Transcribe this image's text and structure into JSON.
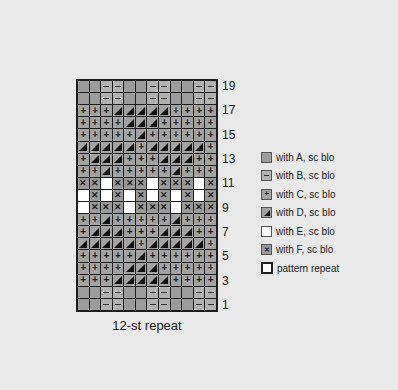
{
  "chart_data": {
    "type": "table",
    "title": "",
    "caption": "12-st repeat",
    "columns": 12,
    "rows": 19,
    "row_labels_shown": [
      "19",
      "17",
      "15",
      "13",
      "11",
      "9",
      "7",
      "5",
      "3",
      "1"
    ],
    "grid_top_to_bottom": [
      {
        "row": 19,
        "cells": [
          "A",
          "A",
          "B",
          "B",
          "A",
          "A",
          "B",
          "B",
          "A",
          "A",
          "B",
          "B"
        ]
      },
      {
        "row": 18,
        "cells": [
          "A",
          "A",
          "B",
          "B",
          "A",
          "A",
          "B",
          "B",
          "A",
          "A",
          "B",
          "B"
        ]
      },
      {
        "row": 17,
        "cells": [
          "C",
          "C",
          "C",
          "D",
          "D",
          "D",
          "D",
          "D",
          "C",
          "C",
          "C",
          "C"
        ]
      },
      {
        "row": 16,
        "cells": [
          "C",
          "C",
          "C",
          "C",
          "D",
          "D",
          "D",
          "C",
          "C",
          "C",
          "C",
          "C"
        ]
      },
      {
        "row": 15,
        "cells": [
          "C",
          "C",
          "C",
          "C",
          "C",
          "D",
          "C",
          "C",
          "C",
          "C",
          "C",
          "C"
        ]
      },
      {
        "row": 14,
        "cells": [
          "D",
          "D",
          "D",
          "D",
          "D",
          "C",
          "D",
          "D",
          "D",
          "D",
          "D",
          "C"
        ]
      },
      {
        "row": 13,
        "cells": [
          "C",
          "D",
          "D",
          "D",
          "C",
          "C",
          "C",
          "D",
          "D",
          "D",
          "C",
          "C"
        ]
      },
      {
        "row": 12,
        "cells": [
          "C",
          "C",
          "D",
          "C",
          "C",
          "C",
          "C",
          "C",
          "D",
          "C",
          "C",
          "C"
        ]
      },
      {
        "row": 11,
        "cells": [
          "F",
          "F",
          "E",
          "F",
          "F",
          "F",
          "E",
          "F",
          "F",
          "F",
          "E",
          "F"
        ]
      },
      {
        "row": 10,
        "cells": [
          "E",
          "F",
          "E",
          "F",
          "E",
          "F",
          "E",
          "F",
          "E",
          "F",
          "E",
          "F"
        ]
      },
      {
        "row": 9,
        "cells": [
          "E",
          "F",
          "F",
          "F",
          "E",
          "F",
          "F",
          "F",
          "E",
          "F",
          "F",
          "F"
        ]
      },
      {
        "row": 8,
        "cells": [
          "C",
          "C",
          "D",
          "C",
          "C",
          "C",
          "C",
          "C",
          "D",
          "C",
          "C",
          "C"
        ]
      },
      {
        "row": 7,
        "cells": [
          "C",
          "D",
          "D",
          "D",
          "C",
          "C",
          "C",
          "D",
          "D",
          "D",
          "C",
          "C"
        ]
      },
      {
        "row": 6,
        "cells": [
          "D",
          "D",
          "D",
          "D",
          "D",
          "C",
          "D",
          "D",
          "D",
          "D",
          "D",
          "C"
        ]
      },
      {
        "row": 5,
        "cells": [
          "C",
          "C",
          "C",
          "C",
          "C",
          "D",
          "C",
          "C",
          "C",
          "C",
          "C",
          "C"
        ]
      },
      {
        "row": 4,
        "cells": [
          "C",
          "C",
          "C",
          "C",
          "D",
          "D",
          "D",
          "C",
          "C",
          "C",
          "C",
          "C"
        ]
      },
      {
        "row": 3,
        "cells": [
          "C",
          "C",
          "C",
          "D",
          "D",
          "D",
          "D",
          "D",
          "C",
          "C",
          "C",
          "C"
        ]
      },
      {
        "row": 2,
        "cells": [
          "A",
          "A",
          "B",
          "B",
          "A",
          "A",
          "B",
          "B",
          "A",
          "A",
          "B",
          "B"
        ]
      },
      {
        "row": 1,
        "cells": [
          "A",
          "A",
          "B",
          "B",
          "A",
          "A",
          "B",
          "B",
          "A",
          "A",
          "B",
          "B"
        ]
      }
    ],
    "legend": [
      {
        "key": "A",
        "label": "with A, sc blo",
        "symbol": "none"
      },
      {
        "key": "B",
        "label": "with B, sc blo",
        "symbol": "minus"
      },
      {
        "key": "C",
        "label": "with C, sc blo",
        "symbol": "plus"
      },
      {
        "key": "D",
        "label": "with D, sc blo",
        "symbol": "triangle"
      },
      {
        "key": "E",
        "label": "with E, sc blo",
        "symbol": "none"
      },
      {
        "key": "F",
        "label": "with F, sc blo",
        "symbol": "x"
      },
      {
        "key": "repeat",
        "label": "pattern repeat",
        "symbol": "outline"
      }
    ]
  },
  "colors": {
    "background": "#e9e9e9",
    "A": "#9c9c9c",
    "B": "#b2b2b2",
    "C": "#a3a3a3",
    "D": "#a3a3a3",
    "E": "#ffffff",
    "F": "#9a9a9a",
    "outline": "#1e1e1e"
  },
  "row_numbers": [
    "19",
    "",
    "17",
    "",
    "15",
    "",
    "13",
    "",
    "11",
    "",
    "9",
    "",
    "7",
    "",
    "5",
    "",
    "3",
    "",
    "1"
  ],
  "caption": "12-st repeat",
  "legend": {
    "items": [
      {
        "label": "with A, sc blo"
      },
      {
        "label": "with B, sc blo"
      },
      {
        "label": "with C, sc blo"
      },
      {
        "label": "with D, sc blo"
      },
      {
        "label": "with E, sc blo"
      },
      {
        "label": "with F, sc blo"
      },
      {
        "label": "pattern repeat"
      }
    ]
  }
}
